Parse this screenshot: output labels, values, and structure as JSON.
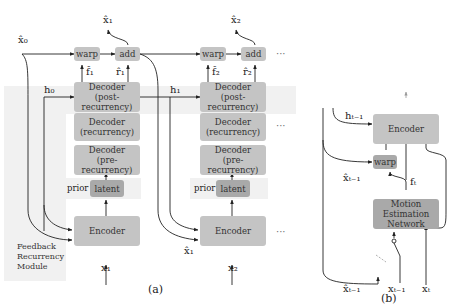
{
  "panel_a": {
    "caption": "(a)",
    "feedback_module_label": [
      "Feedback",
      "Recurrency",
      "Module"
    ],
    "steps": [
      {
        "warp": "warp",
        "add": "add",
        "flow": "f̂₁",
        "residual": "r̂₁",
        "output": "x̂₁",
        "decoder_post": [
          "Decoder",
          "(post-recurrency)"
        ],
        "decoder_rec": [
          "Decoder",
          "(recurrency)"
        ],
        "decoder_pre": [
          "Decoder",
          "(pre-recurrency)"
        ],
        "prior": "prior",
        "latent": "latent",
        "encoder": "Encoder",
        "input": "x₁",
        "hidden_in": "h₀",
        "prev_recon": "x̂₀"
      },
      {
        "warp": "warp",
        "add": "add",
        "flow": "f̂₂",
        "residual": "r̂₂",
        "output": "x̂₂",
        "decoder_post": [
          "Decoder",
          "(post-recurrency)"
        ],
        "decoder_rec": [
          "Decoder",
          "(recurrency)"
        ],
        "decoder_pre": [
          "Decoder",
          "(pre-recurrency)"
        ],
        "prior": "prior",
        "latent": "latent",
        "encoder": "Encoder",
        "input": "x₂",
        "hidden_in": "h₁",
        "prev_recon": "x̂₁"
      }
    ],
    "ellipsis": "···"
  },
  "panel_b": {
    "caption": "(b)",
    "encoder": "Encoder",
    "warp": "warp",
    "motion_net": [
      "Motion",
      "Estimation",
      "Network"
    ],
    "hidden_in": "hₜ₋₁",
    "flow": "fₜ",
    "prev_recon_warp": "x̂ₜ₋₁",
    "inputs": [
      "x̂ₜ₋₁",
      "xₜ₋₁",
      "xₜ"
    ]
  }
}
